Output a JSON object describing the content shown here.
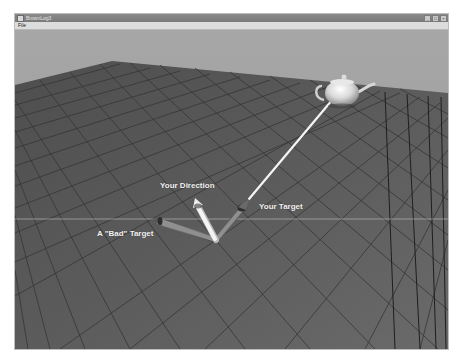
{
  "window": {
    "title": "BrownLog3",
    "controls": {
      "minimize": "_",
      "maximize": "□",
      "close": "×"
    }
  },
  "menu": {
    "items": [
      {
        "label": "File"
      }
    ]
  },
  "scene": {
    "labels": {
      "direction": "Your Direction",
      "target": "Your Target",
      "bad_target": "A \"Bad\" Target"
    },
    "colors": {
      "sky": "#a3a3a3",
      "floor": "#5a5a5a",
      "grid": "#3a3a3a",
      "direction_arrow": "#f0f0f0",
      "target_arrows": "#8a8a8a",
      "target_line": "#f5f5f5",
      "teapot": "#e8e8e8"
    },
    "objects": [
      {
        "name": "teapot",
        "icon": "teapot-icon"
      },
      {
        "name": "direction-arrow",
        "icon": "arrow-icon"
      },
      {
        "name": "target-arrow",
        "icon": "arrow-icon"
      },
      {
        "name": "bad-target-arrow",
        "icon": "arrow-icon"
      }
    ]
  }
}
